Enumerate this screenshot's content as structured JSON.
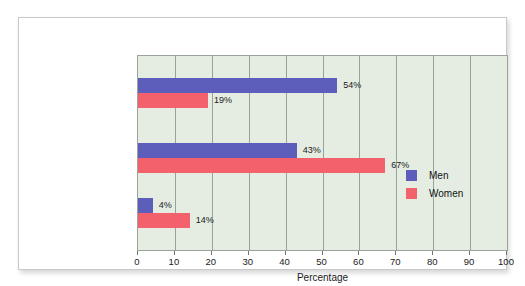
{
  "chart_data": {
    "type": "bar",
    "orientation": "horizontal",
    "title": "",
    "xlabel": "Percentage",
    "ylabel": "",
    "xlim": [
      0,
      100
    ],
    "xticks": [
      0,
      10,
      20,
      30,
      40,
      50,
      60,
      70,
      80,
      90,
      100
    ],
    "xtick_labels": [
      "0",
      "10",
      "20",
      "30",
      "40",
      "50",
      "60",
      "70",
      "80",
      "90",
      "100"
    ],
    "grid": "vertical",
    "legend_position": "inside-right",
    "categories": [
      "“Every day” or\n“Several times\na day”",
      "“A few times a\nmonth” or “A few\ntimes a week”",
      "“Less than once\na month” or\n“Never”"
    ],
    "series": [
      {
        "name": "Men",
        "color": "#5d5dbb",
        "values": [
          54,
          43,
          4
        ],
        "value_labels": [
          "54%",
          "43%",
          "4%"
        ]
      },
      {
        "name": "Women",
        "color": "#f2616c",
        "values": [
          19,
          67,
          14
        ],
        "value_labels": [
          "19%",
          "67%",
          "14%"
        ]
      }
    ],
    "plot_background": "#e5ede3",
    "card_background": "#ffffff"
  },
  "legend": {
    "items": [
      {
        "label": "Men",
        "color": "#5d5dbb"
      },
      {
        "label": "Women",
        "color": "#f2616c"
      }
    ]
  },
  "axis": {
    "title": "Percentage"
  }
}
